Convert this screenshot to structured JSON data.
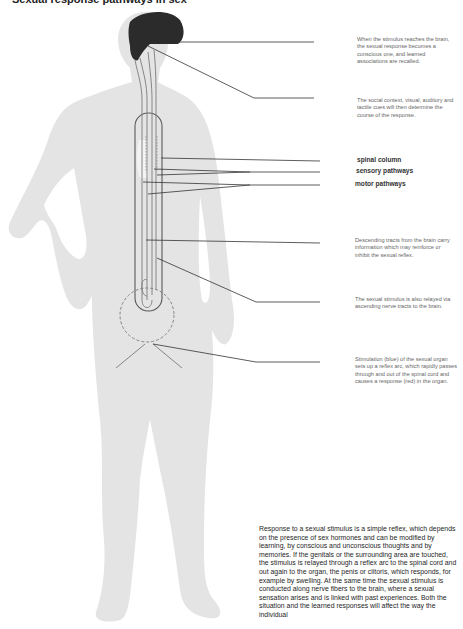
{
  "title": "Sexual response pathways in sex",
  "labels": {
    "spinal_column": "spinal column",
    "sensory_pathways": "sensory pathways",
    "motor_pathways": "motor pathways"
  },
  "annotations": [
    "When the stimulus reaches the brain, the sexual response becomes a conscious one, and learned associations are recalled.",
    "The social context, visual, auditory and tactile cues will then determine the course of the response.",
    "Descending tracts from the brain carry information which may reinforce or inhibit the sexual reflex.",
    "The sexual stimulus is also relayed via ascending nerve tracts to the brain.",
    "Stimulation (blue) of the sexual organ sets up a reflex arc, which rapidly passes through and out of the spinal cord and causes a response (red) in the organ."
  ],
  "body_text": "Response to a sexual stimulus is a simple reflex, which depends on the presence of sex hormones and can be modified by learning, by conscious and unconscious thoughts and by memories. If the genitals or the surrounding area are touched, the stimulus is relayed through a reflex arc to the spinal cord and out again to the organ, the penis or clitoris, which responds, for example by swelling. At the same time the sexual stimulus is conducted along nerve fibers to the brain, where a sexual sensation arises and is linked with past experiences. Both the situation and the learned responses will affect the way the individual",
  "colors": {
    "silhouette": "#e4e4e4",
    "brain": "#2b2b2b",
    "pathway": "#7a7a7a",
    "leader_line": "#333333"
  }
}
